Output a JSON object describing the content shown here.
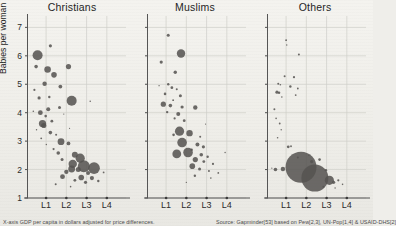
{
  "chart_data": {
    "type": "scatter",
    "title": "",
    "xlabel": "GDP per capita in dollars adjusted for price differences",
    "ylabel": "Babies per woman",
    "xticks": [
      "L1",
      "L2",
      "L3",
      "L4"
    ],
    "yticks": [
      "1",
      "2",
      "3",
      "4",
      "5",
      "6",
      "7"
    ],
    "ylim": [
      1,
      7.4
    ],
    "xlim": [
      0,
      4.6
    ],
    "grid": true,
    "legend": "none",
    "bubble_encoding": "population",
    "panels": [
      {
        "label": "Christians",
        "points": [
          {
            "x": 0.45,
            "y": 6.02,
            "r": 5.0
          },
          {
            "x": 0.38,
            "y": 5.62,
            "r": 1.8
          },
          {
            "x": 1.05,
            "y": 6.35,
            "r": 1.6
          },
          {
            "x": 0.92,
            "y": 5.52,
            "r": 3.3
          },
          {
            "x": 1.22,
            "y": 5.33,
            "r": 2.8
          },
          {
            "x": 1.9,
            "y": 5.62,
            "r": 2.6
          },
          {
            "x": 0.78,
            "y": 5.02,
            "r": 2.2
          },
          {
            "x": 0.3,
            "y": 4.8,
            "r": 1.1
          },
          {
            "x": 1.52,
            "y": 4.92,
            "r": 1.9
          },
          {
            "x": 0.52,
            "y": 4.52,
            "r": 1.6
          },
          {
            "x": 1.0,
            "y": 4.55,
            "r": 1.2
          },
          {
            "x": 2.05,
            "y": 4.42,
            "r": 5.0
          },
          {
            "x": 2.92,
            "y": 4.4,
            "r": 0.8
          },
          {
            "x": 1.48,
            "y": 4.18,
            "r": 1.5
          },
          {
            "x": 0.95,
            "y": 4.12,
            "r": 2.0
          },
          {
            "x": 0.58,
            "y": 4.0,
            "r": 2.4
          },
          {
            "x": 0.83,
            "y": 3.88,
            "r": 1.3
          },
          {
            "x": 1.12,
            "y": 3.7,
            "r": 1.4
          },
          {
            "x": 0.68,
            "y": 3.62,
            "r": 3.6
          },
          {
            "x": 0.74,
            "y": 3.55,
            "r": 2.6
          },
          {
            "x": 1.05,
            "y": 3.3,
            "r": 1.8
          },
          {
            "x": 1.32,
            "y": 3.22,
            "r": 1.0
          },
          {
            "x": 0.62,
            "y": 3.1,
            "r": 0.9
          },
          {
            "x": 1.55,
            "y": 2.98,
            "r": 3.4
          },
          {
            "x": 1.9,
            "y": 2.92,
            "r": 1.9
          },
          {
            "x": 1.2,
            "y": 2.72,
            "r": 1.1
          },
          {
            "x": 1.42,
            "y": 2.58,
            "r": 1.8
          },
          {
            "x": 2.2,
            "y": 2.52,
            "r": 3.0
          },
          {
            "x": 2.45,
            "y": 2.4,
            "r": 4.6
          },
          {
            "x": 1.6,
            "y": 2.35,
            "r": 1.5
          },
          {
            "x": 2.1,
            "y": 2.2,
            "r": 4.2
          },
          {
            "x": 2.62,
            "y": 2.12,
            "r": 6.0
          },
          {
            "x": 2.05,
            "y": 2.02,
            "r": 3.4
          },
          {
            "x": 2.36,
            "y": 2.0,
            "r": 2.5
          },
          {
            "x": 3.1,
            "y": 2.05,
            "r": 5.8
          },
          {
            "x": 1.8,
            "y": 1.92,
            "r": 2.2
          },
          {
            "x": 2.82,
            "y": 1.88,
            "r": 2.0
          },
          {
            "x": 1.62,
            "y": 1.75,
            "r": 2.4
          },
          {
            "x": 2.5,
            "y": 1.72,
            "r": 2.8
          },
          {
            "x": 3.0,
            "y": 1.7,
            "r": 2.1
          },
          {
            "x": 2.2,
            "y": 1.62,
            "r": 1.4
          },
          {
            "x": 2.7,
            "y": 1.55,
            "r": 1.6
          },
          {
            "x": 3.3,
            "y": 1.6,
            "r": 1.2
          },
          {
            "x": 1.3,
            "y": 1.48,
            "r": 1.0
          },
          {
            "x": 2.0,
            "y": 1.4,
            "r": 0.8
          },
          {
            "x": 3.55,
            "y": 1.9,
            "r": 0.9
          },
          {
            "x": 0.4,
            "y": 3.4,
            "r": 0.7
          },
          {
            "x": 0.25,
            "y": 4.05,
            "r": 0.8
          },
          {
            "x": 0.86,
            "y": 2.88,
            "r": 0.7
          },
          {
            "x": 1.68,
            "y": 3.95,
            "r": 0.6
          },
          {
            "x": 1.95,
            "y": 3.45,
            "r": 0.6
          }
        ]
      },
      {
        "label": "Muslims",
        "points": [
          {
            "x": 0.95,
            "y": 6.72,
            "r": 1.5
          },
          {
            "x": 1.55,
            "y": 6.08,
            "r": 4.2
          },
          {
            "x": 0.62,
            "y": 5.78,
            "r": 1.6
          },
          {
            "x": 1.28,
            "y": 5.42,
            "r": 1.7
          },
          {
            "x": 0.95,
            "y": 5.0,
            "r": 1.2
          },
          {
            "x": 1.12,
            "y": 4.88,
            "r": 1.4
          },
          {
            "x": 1.35,
            "y": 4.82,
            "r": 1.0
          },
          {
            "x": 0.8,
            "y": 4.66,
            "r": 1.3
          },
          {
            "x": 1.52,
            "y": 4.6,
            "r": 1.5
          },
          {
            "x": 1.18,
            "y": 4.44,
            "r": 0.9
          },
          {
            "x": 0.72,
            "y": 4.3,
            "r": 2.6
          },
          {
            "x": 1.05,
            "y": 4.25,
            "r": 1.8
          },
          {
            "x": 1.6,
            "y": 4.2,
            "r": 1.6
          },
          {
            "x": 2.22,
            "y": 4.18,
            "r": 2.2
          },
          {
            "x": 0.9,
            "y": 4.02,
            "r": 1.2
          },
          {
            "x": 1.42,
            "y": 3.95,
            "r": 2.0
          },
          {
            "x": 1.25,
            "y": 3.8,
            "r": 1.1
          },
          {
            "x": 1.7,
            "y": 3.72,
            "r": 1.4
          },
          {
            "x": 1.48,
            "y": 3.35,
            "r": 4.6
          },
          {
            "x": 1.95,
            "y": 3.28,
            "r": 3.2
          },
          {
            "x": 1.2,
            "y": 3.22,
            "r": 1.3
          },
          {
            "x": 2.45,
            "y": 3.15,
            "r": 1.0
          },
          {
            "x": 1.6,
            "y": 2.95,
            "r": 4.8
          },
          {
            "x": 2.32,
            "y": 2.88,
            "r": 2.0
          },
          {
            "x": 2.6,
            "y": 2.8,
            "r": 1.6
          },
          {
            "x": 2.05,
            "y": 2.7,
            "r": 1.2
          },
          {
            "x": 1.35,
            "y": 2.55,
            "r": 4.4
          },
          {
            "x": 1.88,
            "y": 2.6,
            "r": 4.8
          },
          {
            "x": 2.5,
            "y": 2.52,
            "r": 1.8
          },
          {
            "x": 2.8,
            "y": 2.45,
            "r": 1.2
          },
          {
            "x": 2.22,
            "y": 2.35,
            "r": 2.6
          },
          {
            "x": 2.62,
            "y": 2.28,
            "r": 1.4
          },
          {
            "x": 2.08,
            "y": 2.12,
            "r": 2.8
          },
          {
            "x": 3.05,
            "y": 2.2,
            "r": 1.1
          },
          {
            "x": 2.42,
            "y": 2.02,
            "r": 1.5
          },
          {
            "x": 2.86,
            "y": 1.95,
            "r": 1.0
          },
          {
            "x": 3.3,
            "y": 1.88,
            "r": 0.9
          },
          {
            "x": 2.2,
            "y": 1.78,
            "r": 1.2
          },
          {
            "x": 2.95,
            "y": 1.7,
            "r": 0.8
          },
          {
            "x": 3.62,
            "y": 2.6,
            "r": 0.7
          },
          {
            "x": 0.52,
            "y": 4.95,
            "r": 0.7
          },
          {
            "x": 2.7,
            "y": 3.6,
            "r": 0.6
          },
          {
            "x": 1.8,
            "y": 1.55,
            "r": 0.7
          }
        ]
      },
      {
        "label": "Others",
        "points": [
          {
            "x": 0.85,
            "y": 6.55,
            "r": 0.9
          },
          {
            "x": 0.88,
            "y": 6.38,
            "r": 0.7
          },
          {
            "x": 1.45,
            "y": 6.05,
            "r": 1.0
          },
          {
            "x": 0.78,
            "y": 5.28,
            "r": 1.0
          },
          {
            "x": 1.22,
            "y": 5.25,
            "r": 1.1
          },
          {
            "x": 0.48,
            "y": 5.02,
            "r": 1.0
          },
          {
            "x": 0.58,
            "y": 4.98,
            "r": 0.8
          },
          {
            "x": 1.05,
            "y": 4.92,
            "r": 1.2
          },
          {
            "x": 1.4,
            "y": 4.85,
            "r": 0.9
          },
          {
            "x": 0.42,
            "y": 4.72,
            "r": 1.6
          },
          {
            "x": 0.52,
            "y": 4.7,
            "r": 1.2
          },
          {
            "x": 1.3,
            "y": 4.62,
            "r": 0.9
          },
          {
            "x": 0.65,
            "y": 4.55,
            "r": 0.8
          },
          {
            "x": 0.3,
            "y": 4.12,
            "r": 1.0
          },
          {
            "x": 0.38,
            "y": 3.8,
            "r": 0.8
          },
          {
            "x": 0.55,
            "y": 3.62,
            "r": 0.9
          },
          {
            "x": 0.62,
            "y": 3.4,
            "r": 0.7
          },
          {
            "x": 0.45,
            "y": 3.12,
            "r": 0.8
          },
          {
            "x": 0.95,
            "y": 2.8,
            "r": 1.4
          },
          {
            "x": 1.08,
            "y": 2.82,
            "r": 0.9
          },
          {
            "x": 1.4,
            "y": 2.42,
            "r": 1.0
          },
          {
            "x": 1.55,
            "y": 2.08,
            "r": 15.5
          },
          {
            "x": 2.2,
            "y": 1.7,
            "r": 13.5
          },
          {
            "x": 0.35,
            "y": 2.0,
            "r": 1.8
          },
          {
            "x": 0.7,
            "y": 2.02,
            "r": 2.2
          },
          {
            "x": 2.05,
            "y": 2.28,
            "r": 1.6
          },
          {
            "x": 2.42,
            "y": 2.35,
            "r": 1.3
          },
          {
            "x": 2.72,
            "y": 1.98,
            "r": 1.2
          },
          {
            "x": 2.88,
            "y": 1.62,
            "r": 4.6
          },
          {
            "x": 3.08,
            "y": 1.55,
            "r": 1.6
          },
          {
            "x": 3.3,
            "y": 1.62,
            "r": 1.1
          },
          {
            "x": 3.5,
            "y": 1.48,
            "r": 0.8
          },
          {
            "x": 2.6,
            "y": 1.4,
            "r": 0.9
          },
          {
            "x": 3.15,
            "y": 1.35,
            "r": 0.7
          },
          {
            "x": 1.92,
            "y": 2.5,
            "r": 0.7
          },
          {
            "x": 0.18,
            "y": 2.05,
            "r": 0.6
          }
        ]
      }
    ]
  },
  "footnotes": {
    "left": "X-axis GDP per capita in dollars adjusted for price differences.",
    "right": "Source: Gapminder[53] based on Pew[2,3], UN-Pop[1,4] & USAID-DHS[2]"
  }
}
